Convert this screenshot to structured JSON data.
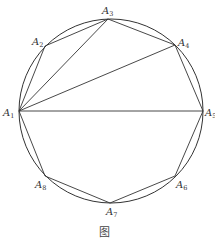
{
  "figure": {
    "caption": "图",
    "circle": {
      "cx": 111,
      "cy": 111,
      "r": 92,
      "stroke": "#333333"
    },
    "vertices": [
      {
        "name": "A",
        "sub": "1",
        "x": 19,
        "y": 111,
        "lx": 3,
        "ly": 116
      },
      {
        "name": "A",
        "sub": "2",
        "x": 45,
        "y": 46,
        "lx": 32,
        "ly": 45
      },
      {
        "name": "A",
        "sub": "3",
        "x": 108,
        "y": 19,
        "lx": 102,
        "ly": 14
      },
      {
        "name": "A",
        "sub": "4",
        "x": 175,
        "y": 45,
        "lx": 178,
        "ly": 46
      },
      {
        "name": "A",
        "sub": "5",
        "x": 203,
        "y": 111,
        "lx": 205,
        "ly": 116
      },
      {
        "name": "A",
        "sub": "6",
        "x": 175,
        "y": 176,
        "lx": 176,
        "ly": 188
      },
      {
        "name": "A",
        "sub": "7",
        "x": 110,
        "y": 203,
        "lx": 106,
        "ly": 215
      },
      {
        "name": "A",
        "sub": "8",
        "x": 45,
        "y": 176,
        "lx": 35,
        "ly": 188
      }
    ],
    "diagonals": [
      [
        "1",
        "3"
      ],
      [
        "1",
        "4"
      ],
      [
        "1",
        "5"
      ]
    ]
  }
}
